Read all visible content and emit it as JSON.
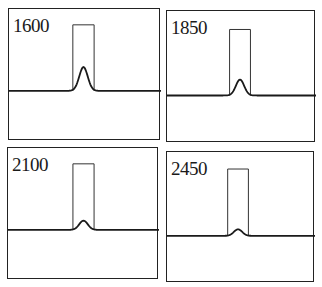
{
  "chart_data": {
    "type": "line",
    "title": "",
    "layout": "2x2 grid of panels",
    "xlabel": "",
    "ylabel": "",
    "grid": false,
    "axis_ticks": false,
    "panels": [
      {
        "label": "1600",
        "series": [
          {
            "name": "rectangular pulse",
            "shape": "rect",
            "x_start": 0.42,
            "x_end": 0.56,
            "top": 0.88,
            "baseline": 0.38
          },
          {
            "name": "gaussian response",
            "shape": "gaussian",
            "center": 0.49,
            "peak": 0.56,
            "baseline": 0.38
          }
        ]
      },
      {
        "label": "1850",
        "series": [
          {
            "name": "rectangular pulse",
            "shape": "rect",
            "x_start": 0.42,
            "x_end": 0.56,
            "top": 0.86,
            "baseline": 0.36
          },
          {
            "name": "gaussian response",
            "shape": "gaussian",
            "center": 0.49,
            "peak": 0.48,
            "baseline": 0.36
          }
        ]
      },
      {
        "label": "2100",
        "series": [
          {
            "name": "rectangular pulse",
            "shape": "rect",
            "x_start": 0.43,
            "x_end": 0.57,
            "top": 0.88,
            "baseline": 0.38
          },
          {
            "name": "gaussian response",
            "shape": "gaussian",
            "center": 0.5,
            "peak": 0.45,
            "baseline": 0.38
          }
        ]
      },
      {
        "label": "2450",
        "series": [
          {
            "name": "rectangular pulse",
            "shape": "rect",
            "x_start": 0.41,
            "x_end": 0.55,
            "top": 0.87,
            "baseline": 0.36
          },
          {
            "name": "gaussian response",
            "shape": "gaussian",
            "center": 0.48,
            "peak": 0.41,
            "baseline": 0.36
          }
        ]
      }
    ]
  },
  "panels": [
    {
      "label": "1600"
    },
    {
      "label": "1850"
    },
    {
      "label": "2100"
    },
    {
      "label": "2450"
    }
  ]
}
